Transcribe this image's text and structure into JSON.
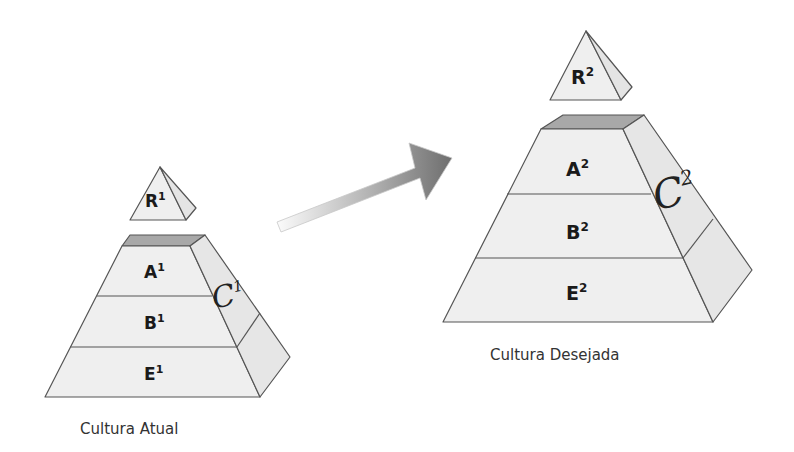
{
  "diagram": {
    "left": {
      "caption": "Cultura Atual",
      "top": {
        "letter": "R",
        "sup": "1"
      },
      "layers": [
        {
          "letter": "A",
          "sup": "1"
        },
        {
          "letter": "B",
          "sup": "1"
        },
        {
          "letter": "E",
          "sup": "1"
        }
      ],
      "side": {
        "letter": "C",
        "sup": "1"
      }
    },
    "right": {
      "caption": "Cultura Desejada",
      "top": {
        "letter": "R",
        "sup": "2"
      },
      "layers": [
        {
          "letter": "A",
          "sup": "2"
        },
        {
          "letter": "B",
          "sup": "2"
        },
        {
          "letter": "E",
          "sup": "2"
        }
      ],
      "side": {
        "letter": "C",
        "sup": "2"
      }
    },
    "arrow": {
      "direction": "left-to-right"
    },
    "colors": {
      "face": "#efefef",
      "side": "#e6e6e6",
      "top": "#a8a8a8",
      "stroke": "#555555"
    }
  }
}
